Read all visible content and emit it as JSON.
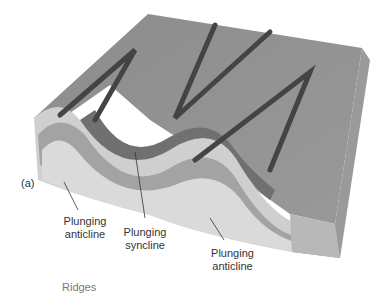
{
  "figure": {
    "panel_label": "(a)",
    "top_caption_cut": "…",
    "bottom_caption_cut": "Ridges",
    "labels": [
      {
        "line1": "Plunging",
        "line2": "anticline"
      },
      {
        "line1": "Plunging",
        "line2": "syncline"
      },
      {
        "line1": "Plunging",
        "line2": "anticline"
      }
    ],
    "colors": {
      "surface": "#8a8a8a",
      "ridge": "#4a4a4a",
      "layer_dark": "#6e6e6e",
      "layer_mid": "#9c9c9c",
      "layer_light": "#c9c9c9",
      "layer_pale": "#dcdcdc"
    }
  }
}
